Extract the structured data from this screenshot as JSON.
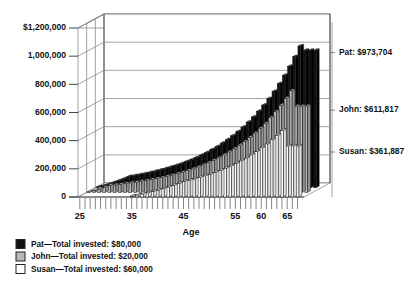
{
  "chart_data": {
    "type": "bar",
    "title": "",
    "xlabel": "Age",
    "ylabel": "",
    "ylim": [
      0,
      1200000
    ],
    "xlim": [
      25,
      67
    ],
    "grid": true,
    "legend_position": "below-left",
    "y_ticks": [
      "$1,200,000",
      "1,000,000",
      "800,000",
      "600,000",
      "400,000",
      "200,000",
      "0"
    ],
    "y_tick_values": [
      1200000,
      1000000,
      800000,
      600000,
      400000,
      200000,
      0
    ],
    "x_ticks": [
      "25",
      "35",
      "45",
      "55",
      "60",
      "65"
    ],
    "x_tick_values": [
      25,
      35,
      45,
      55,
      60,
      65
    ],
    "categories": [
      25,
      26,
      27,
      28,
      29,
      30,
      31,
      32,
      33,
      34,
      35,
      36,
      37,
      38,
      39,
      40,
      41,
      42,
      43,
      44,
      45,
      46,
      47,
      48,
      49,
      50,
      51,
      52,
      53,
      54,
      55,
      56,
      57,
      58,
      59,
      60,
      61,
      62,
      63,
      64,
      65,
      66,
      67
    ],
    "series": [
      {
        "name": "Pat",
        "color": "#111111",
        "final_value": 973704,
        "total_invested": "$80,000",
        "values": [
          2000,
          12000,
          23000,
          35000,
          48000,
          62000,
          78000,
          84000,
          91000,
          98000,
          106000,
          115000,
          124000,
          134000,
          145000,
          156000,
          169000,
          183000,
          197000,
          213000,
          231000,
          249000,
          270000,
          291000,
          315000,
          340000,
          368000,
          397000,
          429000,
          464000,
          501000,
          542000,
          585000,
          632000,
          683000,
          738000,
          797000,
          861000,
          930000,
          1005000,
          973704,
          973704,
          973704
        ]
      },
      {
        "name": "John",
        "color": "#b7b7b7",
        "final_value": 611817,
        "total_invested": "$20,000",
        "values": [
          2000,
          12000,
          23000,
          35000,
          48000,
          52000,
          56000,
          61000,
          66000,
          71000,
          77000,
          83000,
          89000,
          97000,
          104000,
          113000,
          122000,
          132000,
          142000,
          154000,
          166000,
          180000,
          194000,
          210000,
          227000,
          245000,
          265000,
          286000,
          309000,
          334000,
          360000,
          389000,
          420000,
          454000,
          490000,
          530000,
          572000,
          618000,
          668000,
          721000,
          611817,
          611817,
          611817
        ]
      },
      {
        "name": "Susan",
        "color": "#ffffff",
        "final_value": 361887,
        "total_invested": "$60,000",
        "values": [
          0,
          0,
          0,
          0,
          0,
          0,
          0,
          0,
          0,
          0,
          6000,
          13000,
          21000,
          29000,
          38000,
          48000,
          58000,
          70000,
          82000,
          95000,
          109000,
          118000,
          127000,
          138000,
          149000,
          161000,
          174000,
          188000,
          203000,
          219000,
          237000,
          256000,
          276000,
          298000,
          322000,
          348000,
          376000,
          406000,
          438000,
          473000,
          361887,
          361887,
          361887
        ]
      }
    ],
    "annotations": [
      {
        "name": "pat-annotation",
        "text": "Pat: $973,704",
        "value": 973704
      },
      {
        "name": "john-annotation",
        "text": "John: $611,817",
        "value": 611817
      },
      {
        "name": "susan-annotation",
        "text": "Susan: $361,887",
        "value": 361887
      }
    ],
    "legend": [
      {
        "name": "Pat",
        "label": "Pat—Total invested: $80,000",
        "color": "#111111"
      },
      {
        "name": "John",
        "label": "John—Total invested: $20,000",
        "color": "#b7b7b7"
      },
      {
        "name": "Susan",
        "label": "Susan—Total invested: $60,000",
        "color": "#ffffff"
      }
    ]
  }
}
